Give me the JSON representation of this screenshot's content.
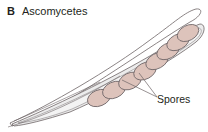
{
  "figure": {
    "panel_label": "B",
    "title": "Ascomycetes",
    "spore_label": "Spores",
    "spore_count": 8,
    "colors": {
      "spore_fill": "#ddc3bb",
      "spore_stroke": "#6d6466",
      "ascus_fill": "#ececec",
      "outline": "#6d6466",
      "text": "#231f20"
    }
  }
}
